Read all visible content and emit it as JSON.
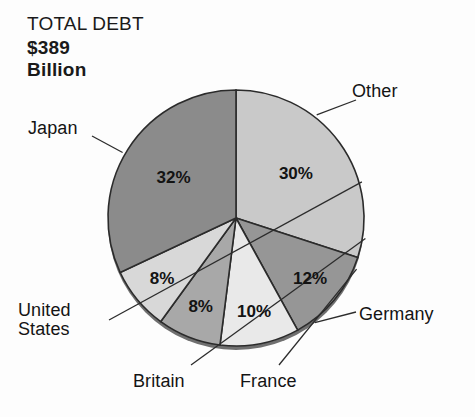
{
  "page": {
    "background_color": "#fdfdfd",
    "clipped_top_text": ""
  },
  "title": {
    "heading": "TOTAL DEBT",
    "amount": "$389",
    "unit": "Billion"
  },
  "chart_data": {
    "type": "pie",
    "title": "TOTAL DEBT $389 Billion",
    "xlabel": "",
    "ylabel": "",
    "legend_position": "callout-labels",
    "grid": false,
    "units": "percent",
    "total_label": "$389 Billion",
    "start_angle_deg": 0,
    "direction": "clockwise",
    "categories": [
      "Other",
      "Germany",
      "France",
      "Britain",
      "United States",
      "Japan"
    ],
    "values": [
      30,
      12,
      10,
      8,
      8,
      32
    ],
    "value_labels": [
      "30%",
      "12%",
      "10%",
      "8%",
      "8%",
      "32%"
    ],
    "colors": [
      "#c9c9c9",
      "#969696",
      "#e9e9e9",
      "#a8a8a8",
      "#d8d8d8",
      "#8b8b8b"
    ],
    "slices": [
      {
        "name": "Other",
        "value": 30,
        "label": "30%",
        "color": "#c9c9c9"
      },
      {
        "name": "Germany",
        "value": 12,
        "label": "12%",
        "color": "#969696"
      },
      {
        "name": "France",
        "value": 10,
        "label": "10%",
        "color": "#e9e9e9"
      },
      {
        "name": "Britain",
        "value": 8,
        "label": "8%",
        "color": "#a8a8a8"
      },
      {
        "name": "United States",
        "value": 8,
        "label": "8%",
        "color": "#d8d8d8"
      },
      {
        "name": "Japan",
        "value": 32,
        "label": "32%",
        "color": "#8b8b8b"
      }
    ]
  },
  "callouts": {
    "other": "Other",
    "japan": "Japan",
    "germany": "Germany",
    "france": "France",
    "britain": "Britain",
    "united_states_line1": "United",
    "united_states_line2": "States"
  }
}
